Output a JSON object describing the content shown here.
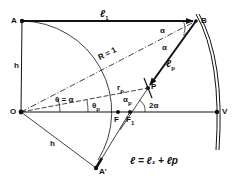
{
  "diagram": {
    "points": {
      "A": "A",
      "B": "B",
      "O": "O",
      "V": "V",
      "P": "P",
      "F": "F",
      "F1": "F",
      "A_prime": "A'"
    },
    "labels": {
      "l1": "ℓ",
      "l1_sub": "1",
      "lp": "ℓ",
      "lp_sub": "p",
      "h_top": "h",
      "h_bottom": "h",
      "R": "R = 1",
      "rp": "r",
      "rp_sub": "p",
      "theta_alpha": "θ = α",
      "theta_p": "θ",
      "theta_p_sub": "p",
      "alpha_top": "α",
      "alpha_mid": "α",
      "alpha_p": "α",
      "alpha_p_sub": "p",
      "two_alpha": "2α",
      "F1_sub": "1",
      "equation": "ℓ = ℓ₁ + ℓp"
    },
    "colors": {
      "ink": "#111111",
      "background": "#ffffff"
    }
  }
}
